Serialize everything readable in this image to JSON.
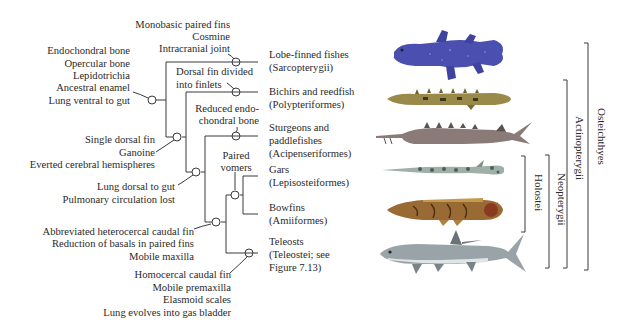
{
  "diagram": {
    "type": "cladogram"
  },
  "characters": {
    "osteichthyes_node": [
      "Endochondral bone",
      "Opercular bone",
      "Lepidotrichia",
      "Ancestral enamel",
      "Lung ventral to gut"
    ],
    "sarcopterygii_branch": [
      "Monobasic paired fins",
      "Cosmine",
      "Intracranial joint"
    ],
    "actinopterygii_node": [
      "Single dorsal fin",
      "Ganoine",
      "Everted cerebral hemispheres"
    ],
    "polypteriformes_branch": [
      "Dorsal fin divided",
      "into finlets"
    ],
    "actinopteri_node": [
      "Lung dorsal to gut",
      "Pulmonary circulation lost"
    ],
    "acipenseriformes_branch": [
      "Reduced endo-",
      "chondral bone"
    ],
    "neopterygii_node": [
      "Abbreviated heterocercal caudal fin",
      "Reduction of basals in paired fins",
      "Mobile maxilla"
    ],
    "holostei_node": [
      "Paired",
      "vomers"
    ],
    "teleostei_branch": [
      "Homocercal caudal fin",
      "Mobile premaxilla",
      "Elasmoid scales",
      "Lung evolves into gas bladder"
    ]
  },
  "taxa": [
    {
      "common": "Lobe-finned fishes",
      "formal": "(Sarcopterygii)"
    },
    {
      "common": "Bichirs and reedfish",
      "formal": "(Polypteriformes)"
    },
    {
      "common": "Sturgeons and",
      "common2": "paddlefishes",
      "formal": "(Acipenseriformes)"
    },
    {
      "common": "Gars",
      "formal": "(Lepisosteiformes)"
    },
    {
      "common": "Bowfins",
      "formal": "(Amiiformes)"
    },
    {
      "common": "Teleosts",
      "formal": "(Teleostei; see",
      "formal2": "Figure 7.13)"
    }
  ],
  "groups": {
    "osteichthyes": "Osteichthyes",
    "actinopterygii": "Actinopterygii",
    "neopterygii": "Neopterygii",
    "holostei": "Holostei"
  },
  "fish_illustrations": [
    "coelacanth",
    "bichir",
    "sturgeon",
    "gar",
    "bowfin",
    "tarpon"
  ],
  "colors": {
    "line": "#3a3a3a",
    "coelacanth": "#4a4fb0",
    "bichir": "#9a8a4a",
    "sturgeon": "#8a7a78",
    "gar": "#9fb0a8",
    "bowfin": "#9a6a35",
    "tarpon": "#9aa4a8"
  }
}
